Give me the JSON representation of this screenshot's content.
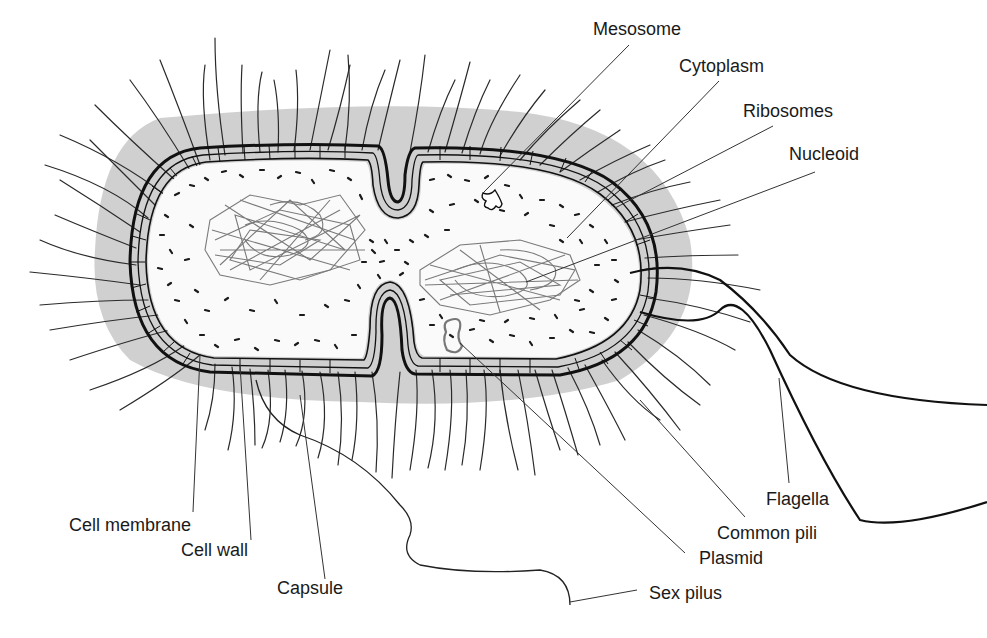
{
  "diagram": {
    "colors": {
      "background": "#ffffff",
      "capsule": "#c8c8c8",
      "outline": "#111111",
      "nucleoid": "#7a7a7a",
      "ribosomes": "#1a1a1a",
      "leader_lines": "#333333"
    },
    "labels": [
      {
        "id": "mesosome",
        "text": "Mesosome",
        "x": 593,
        "y": 20,
        "pointer": [
          [
            629,
            45
          ],
          [
            483,
            193
          ]
        ]
      },
      {
        "id": "cytoplasm",
        "text": "Cytoplasm",
        "x": 679,
        "y": 57,
        "pointer": [
          [
            719,
            81
          ],
          [
            567,
            238
          ]
        ]
      },
      {
        "id": "ribosomes",
        "text": "Ribosomes",
        "x": 743,
        "y": 102,
        "pointer": [
          [
            773,
            126
          ],
          [
            615,
            208
          ]
        ]
      },
      {
        "id": "nucleoid",
        "text": "Nucleoid",
        "x": 789,
        "y": 145,
        "pointer": [
          [
            815,
            172
          ],
          [
            526,
            282
          ]
        ]
      },
      {
        "id": "flagella",
        "text": "Flagella",
        "x": 766,
        "y": 490,
        "pointer": [
          [
            789,
            483
          ],
          [
            779,
            378
          ]
        ]
      },
      {
        "id": "common-pili",
        "text": "Common pili",
        "x": 717,
        "y": 524,
        "pointer": [
          [
            745,
            517
          ],
          [
            640,
            400
          ]
        ]
      },
      {
        "id": "plasmid",
        "text": "Plasmid",
        "x": 699,
        "y": 549,
        "pointer": [
          [
            685,
            553
          ],
          [
            460,
            343
          ]
        ]
      },
      {
        "id": "sex-pilus",
        "text": "Sex pilus",
        "x": 649,
        "y": 584,
        "pointer": [
          [
            637,
            590
          ],
          [
            570,
            602
          ]
        ]
      },
      {
        "id": "cell-membrane",
        "text": "Cell membrane",
        "x": 69,
        "y": 516,
        "pointer": [
          [
            193,
            512
          ],
          [
            200,
            355
          ]
        ]
      },
      {
        "id": "cell-wall",
        "text": "Cell wall",
        "x": 181,
        "y": 541,
        "pointer": [
          [
            251,
            540
          ],
          [
            240,
            365
          ]
        ]
      },
      {
        "id": "capsule",
        "text": "Capsule",
        "x": 277,
        "y": 579,
        "pointer": [
          [
            325,
            579
          ],
          [
            300,
            395
          ]
        ]
      }
    ]
  }
}
